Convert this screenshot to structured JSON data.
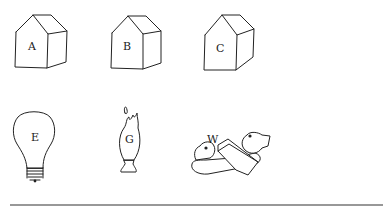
{
  "figure": {
    "houses": [
      {
        "label": "A"
      },
      {
        "label": "B"
      },
      {
        "label": "C"
      }
    ],
    "objects": [
      {
        "label": "E",
        "type": "light-bulb"
      },
      {
        "label": "G",
        "type": "gas-flame"
      },
      {
        "label": "W",
        "type": "faucet"
      }
    ]
  }
}
